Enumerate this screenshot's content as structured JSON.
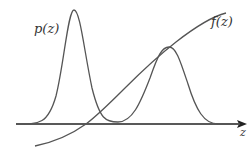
{
  "figure": {
    "type": "diagram",
    "labels": {
      "density": "p(z)",
      "function": "f(z)",
      "axis": "z"
    },
    "colors": {
      "curve": "#555555",
      "axis": "#222222",
      "background": "#ffffff"
    },
    "curves": {
      "density": "M16,124 C40,124 48,124 56,96 C64,64 68,10 74,10 C80,10 84,50 92,88 C100,120 106,122 118,122 C132,122 140,104 150,78 C158,55 162,47 169,47 C176,47 180,60 188,84 C196,110 204,124 218,124 L240,124",
      "function": "M35,146 C55,142 72,134 86,124 C98,115 110,103 124,89 C140,73 158,56 176,42 C194,28 210,17 226,13"
    },
    "axis": {
      "x1": 16,
      "y1": 124,
      "x2": 240,
      "y2": 124,
      "arrow_tip": [
        247,
        124
      ]
    }
  }
}
